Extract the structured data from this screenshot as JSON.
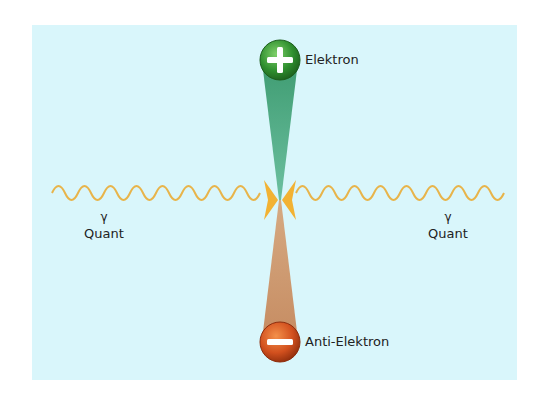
{
  "diagram": {
    "type": "pair-annihilation",
    "background_color": "#d9f6fb",
    "particles": [
      {
        "id": "electron",
        "label": "Elektron",
        "symbol": "+",
        "color": "#3a9a3a",
        "cone_color": "#5fb38a"
      },
      {
        "id": "anti-electron",
        "label": "Anti-Elektron",
        "symbol": "−",
        "color": "#d2501e",
        "cone_color": "#c99a72"
      }
    ],
    "photons": [
      {
        "side": "left",
        "symbol": "γ",
        "label": "Quant",
        "wave_color": "#e8b44a",
        "arrow_color": "#f2b233"
      },
      {
        "side": "right",
        "symbol": "γ",
        "label": "Quant",
        "wave_color": "#e8b44a",
        "arrow_color": "#f2b233"
      }
    ]
  }
}
